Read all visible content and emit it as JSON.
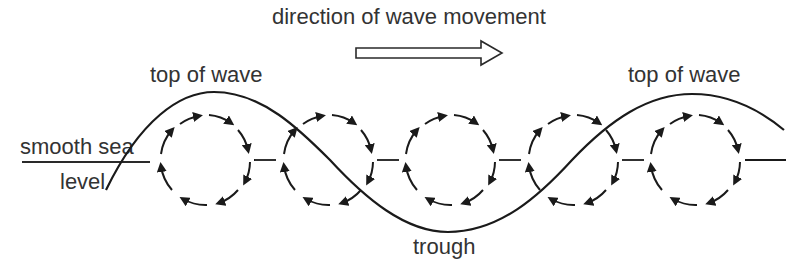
{
  "diagram": {
    "title": "direction of wave movement",
    "labels": {
      "top_of_wave_left": "top of wave",
      "top_of_wave_right": "top of wave",
      "smooth_sea": "smooth sea",
      "level": "level",
      "trough": "trough"
    },
    "direction_arrow": {
      "type": "hollow-arrow",
      "direction": "right"
    },
    "orbits": {
      "count": 5,
      "rotation": "clockwise",
      "style": "dashed-with-arrowheads"
    },
    "colors": {
      "stroke": "#1a1a1a",
      "text": "#333333",
      "background": "#ffffff"
    }
  }
}
